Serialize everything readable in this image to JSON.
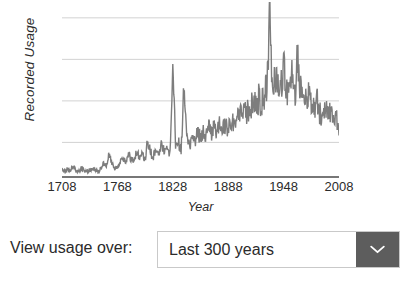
{
  "chart_data": {
    "type": "line",
    "title": "",
    "xlabel": "Year",
    "ylabel": "Recorded Usage",
    "xlim": [
      1708,
      2008
    ],
    "ylim": [
      0,
      100
    ],
    "grid": true,
    "gridlines_y": [
      20,
      44,
      68,
      92
    ],
    "legend": "none",
    "line_color": "#7d7d7d",
    "axis_color": "#4a4a4a",
    "gridline_color": "#d2d2d2",
    "xticks": [
      1708,
      1768,
      1828,
      1888,
      1948,
      2008
    ],
    "series": [
      {
        "name": "Recorded Usage",
        "x": [
          1708,
          1711,
          1714,
          1717,
          1720,
          1723,
          1726,
          1729,
          1732,
          1735,
          1738,
          1741,
          1744,
          1747,
          1750,
          1753,
          1756,
          1759,
          1762,
          1765,
          1768,
          1771,
          1774,
          1777,
          1780,
          1783,
          1786,
          1789,
          1792,
          1795,
          1798,
          1801,
          1804,
          1807,
          1810,
          1813,
          1816,
          1819,
          1822,
          1825,
          1828,
          1831,
          1834,
          1837,
          1840,
          1843,
          1846,
          1849,
          1852,
          1855,
          1858,
          1861,
          1864,
          1867,
          1870,
          1873,
          1876,
          1879,
          1882,
          1885,
          1888,
          1891,
          1894,
          1897,
          1900,
          1903,
          1906,
          1909,
          1912,
          1915,
          1918,
          1921,
          1924,
          1927,
          1930,
          1933,
          1936,
          1939,
          1942,
          1945,
          1948,
          1951,
          1954,
          1957,
          1960,
          1963,
          1966,
          1969,
          1972,
          1975,
          1978,
          1981,
          1984,
          1987,
          1990,
          1993,
          1996,
          1999,
          2002,
          2005,
          2008
        ],
        "values": [
          4,
          3,
          5,
          4,
          6,
          4,
          3,
          5,
          4,
          3,
          4,
          5,
          4,
          3,
          5,
          9,
          6,
          13,
          8,
          5,
          6,
          9,
          12,
          8,
          14,
          10,
          9,
          15,
          11,
          13,
          10,
          22,
          14,
          12,
          16,
          13,
          19,
          14,
          17,
          13,
          62,
          18,
          20,
          16,
          52,
          22,
          18,
          24,
          20,
          26,
          22,
          27,
          24,
          28,
          25,
          30,
          26,
          31,
          28,
          30,
          29,
          33,
          31,
          35,
          33,
          37,
          36,
          38,
          40,
          42,
          41,
          45,
          43,
          48,
          52,
          90,
          56,
          60,
          58,
          55,
          62,
          52,
          48,
          58,
          46,
          70,
          52,
          50,
          48,
          46,
          42,
          40,
          44,
          38,
          36,
          40,
          34,
          38,
          32,
          36,
          24
        ]
      }
    ]
  },
  "figure": {
    "ylabel": "Recorded Usage",
    "xlabel": "Year",
    "xticks": [
      "1708",
      "1768",
      "1828",
      "1888",
      "1948",
      "2008"
    ]
  },
  "control": {
    "label": "View usage over:",
    "selected_value": "Last 300 years",
    "chevron_icon": "chevron-down-icon",
    "button_color": "#5d5d5d"
  }
}
